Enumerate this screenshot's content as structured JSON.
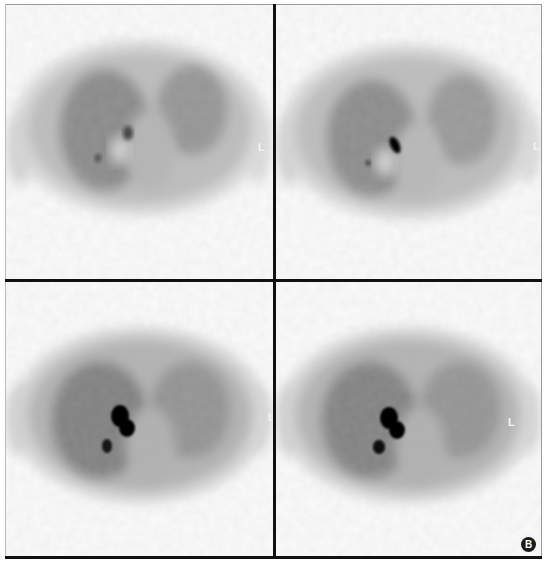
{
  "figure": {
    "panel_label": "B",
    "layout": "2x2 grid of axial PET slices",
    "panels": [
      {
        "id": "top-left",
        "orientation_marker": "L",
        "lesions": [
          {
            "cx": 128,
            "cy": 133,
            "rx": 5,
            "ry": 7
          },
          {
            "cx": 98,
            "cy": 158,
            "rx": 3,
            "ry": 4
          }
        ]
      },
      {
        "id": "top-right",
        "orientation_marker": "L",
        "lesions": [
          {
            "cx": 395,
            "cy": 145,
            "rx": 5,
            "ry": 10
          },
          {
            "cx": 368,
            "cy": 163,
            "rx": 3,
            "ry": 3
          }
        ]
      },
      {
        "id": "bottom-left",
        "orientation_marker": "L",
        "lesions": [
          {
            "cx": 122,
            "cy": 420,
            "rx": 11,
            "ry": 15
          },
          {
            "cx": 107,
            "cy": 446,
            "rx": 6,
            "ry": 8
          }
        ]
      },
      {
        "id": "bottom-right",
        "orientation_marker": "L",
        "lesions": [
          {
            "cx": 392,
            "cy": 424,
            "rx": 13,
            "ry": 15
          },
          {
            "cx": 379,
            "cy": 447,
            "rx": 7,
            "ry": 7
          }
        ]
      }
    ]
  },
  "colors": {
    "background": "#fbfbfb",
    "body_outline": "#d2d2d2",
    "lung_field": "#8a8a8a",
    "lesion": "#050505",
    "divider": "#111111"
  }
}
